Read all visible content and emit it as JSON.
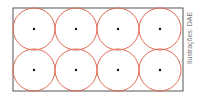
{
  "diagram": {
    "rows": 2,
    "columns": 4,
    "circle_count": 8,
    "colors": {
      "rectangle_stroke": "#555555",
      "circle_stroke": "#e06a55",
      "center_dot": "#111111"
    }
  },
  "credit": {
    "text": "Ilustrações: DAE"
  }
}
